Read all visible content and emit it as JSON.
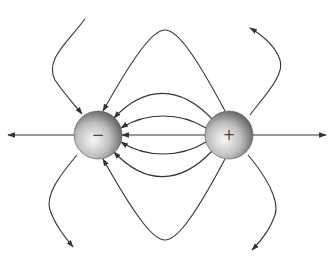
{
  "diagram": {
    "charges": [
      {
        "id": "negative",
        "sign": "−",
        "cx": 98,
        "cy": 135,
        "r": 24
      },
      {
        "id": "positive",
        "sign": "+",
        "cx": 229,
        "cy": 135,
        "r": 24
      }
    ],
    "colors": {
      "line": "#333333",
      "sphere_light": "#f4f4f4",
      "sphere_dark": "#6a6a6a",
      "background": "#ffffff"
    },
    "field_lines": [
      {
        "name": "axis-left",
        "d": "M 74 135 L 8 135"
      },
      {
        "name": "axis-right",
        "d": "M 253 135 L 326 135"
      },
      {
        "name": "center-straight",
        "d": "M 205 135 L 122 135"
      },
      {
        "name": "inner-upper",
        "d": "M 206 128 C 180 112, 146 112, 121 128"
      },
      {
        "name": "inner-lower",
        "d": "M 206 142 C 180 158, 146 158, 121 142"
      },
      {
        "name": "mid-upper",
        "d": "M 212 119 C 180 85, 145 85, 114 118"
      },
      {
        "name": "mid-lower",
        "d": "M 212 151 C 180 185, 145 185, 114 152"
      },
      {
        "name": "outer-upper",
        "d": "M 225 111 C 190 45, 175 30, 165 30 C 155 30, 140 45, 103 111"
      },
      {
        "name": "outer-lower",
        "d": "M 225 159 C 190 225, 175 240, 165 240 C 155 240, 140 225, 103 159"
      },
      {
        "name": "far-upper-left",
        "d": "M 85 19 C 65 45, 45 60, 55 80 C 65 95, 75 105, 82 114"
      },
      {
        "name": "far-lower-left",
        "d": "M 77 155 C 60 175, 45 195, 50 210 C 55 225, 65 237, 73 247"
      },
      {
        "name": "far-upper-right",
        "d": "M 250 115 C 265 95, 285 75, 280 60 C 275 45, 262 35, 250 28"
      },
      {
        "name": "far-lower-right",
        "d": "M 248 155 C 265 175, 280 200, 275 215 C 270 230, 260 242, 252 250"
      }
    ]
  }
}
